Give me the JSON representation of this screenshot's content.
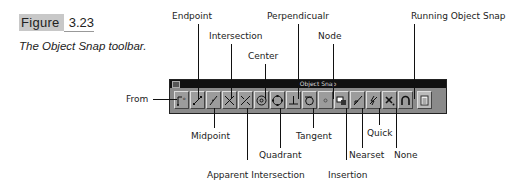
{
  "figure": {
    "label": "Figure",
    "number": "3.23",
    "caption": "The Object Snap toolbar."
  },
  "toolbar": {
    "title": "Object Snap",
    "buttons": [
      {
        "name": "From",
        "icon": "from-icon"
      },
      {
        "name": "Endpoint",
        "icon": "endpoint-icon"
      },
      {
        "name": "Midpoint",
        "icon": "midpoint-icon"
      },
      {
        "name": "Intersection",
        "icon": "intersection-icon"
      },
      {
        "name": "Apparent Intersection",
        "icon": "apparent-intersection-icon"
      },
      {
        "name": "Center",
        "icon": "center-icon"
      },
      {
        "name": "Quadrant",
        "icon": "quadrant-icon"
      },
      {
        "name": "Perpendicualr",
        "icon": "perpendicular-icon"
      },
      {
        "name": "Tangent",
        "icon": "tangent-icon"
      },
      {
        "name": "Node",
        "icon": "node-icon"
      },
      {
        "name": "Insertion",
        "icon": "insertion-icon"
      },
      {
        "name": "Nearset",
        "icon": "nearest-icon"
      },
      {
        "name": "Quick",
        "icon": "quick-icon"
      },
      {
        "name": "None",
        "icon": "none-icon"
      },
      {
        "name": "Running Object Snap",
        "icon": "running-object-snap-icon"
      },
      {
        "name": "",
        "icon": "osnap-settings-icon"
      }
    ]
  },
  "callouts": {
    "from": "From",
    "endpoint": "Endpoint",
    "intersection": "Intersection",
    "center": "Center",
    "perpendicular": "Perpendicualr",
    "node": "Node",
    "running": "Running Object Snap",
    "midpoint": "Midpoint",
    "apparent": "Apparent Intersection",
    "quadrant": "Quadrant",
    "tangent": "Tangent",
    "insertion": "Insertion",
    "nearest": "Nearset",
    "quick": "Quick",
    "none": "None"
  }
}
